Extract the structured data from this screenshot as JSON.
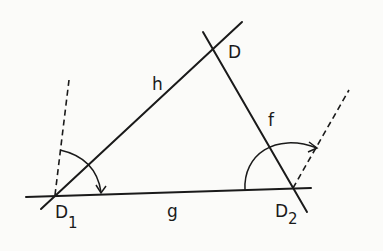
{
  "diagram": {
    "labels": {
      "line_h": "h",
      "line_f": "f",
      "line_g": "g",
      "point_D": "D",
      "point_D1": "D",
      "point_D1_sub": "1",
      "point_D2": "D",
      "point_D2_sub": "2"
    },
    "points": {
      "D": [
        212,
        49
      ],
      "D1": [
        55,
        195
      ],
      "D2": [
        293,
        188
      ]
    },
    "colors": {
      "ink": "#1a1a1a",
      "background": "#fbfbf9"
    }
  }
}
